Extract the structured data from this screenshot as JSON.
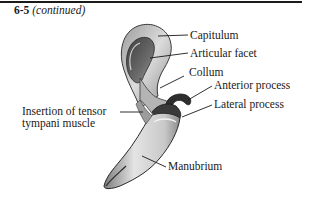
{
  "figure": {
    "number": "6-5",
    "continued": "(continued)"
  },
  "labels": {
    "capitulum": "Capitulum",
    "articular_facet": "Articular facet",
    "collum": "Collum",
    "anterior_process": "Anterior process",
    "lateral_process": "Lateral process",
    "insertion_line1": "Insertion of tensor",
    "insertion_line2": "tympani muscle",
    "manubrium": "Manubrium"
  },
  "colors": {
    "ink": "#1a1a1a",
    "bone_light": "#e6e6e6",
    "bone_mid": "#a8a8a8",
    "bone_dark": "#4a4a4a",
    "background": "#ffffff"
  }
}
